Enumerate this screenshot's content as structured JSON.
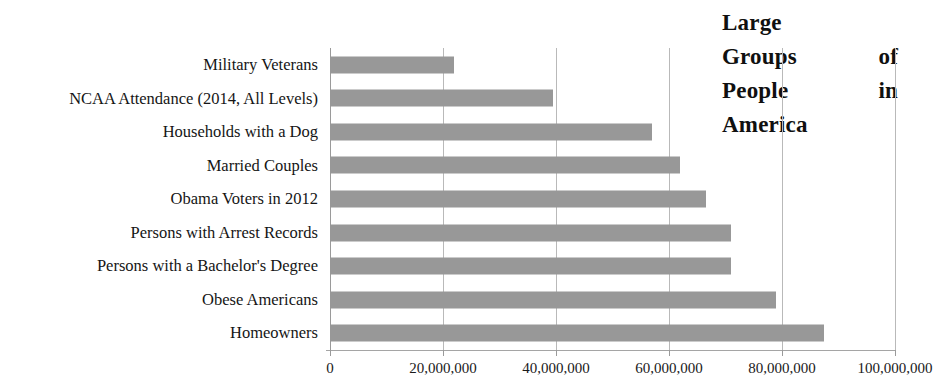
{
  "chart_data": {
    "type": "bar",
    "orientation": "horizontal",
    "title": "Large Groups of People in America",
    "title_lines": [
      "Large",
      "Groups of",
      "People in",
      "America"
    ],
    "xlabel": "",
    "ylabel": "",
    "categories": [
      "Military Veterans",
      "NCAA Attendance (2014, All Levels)",
      "Households with a Dog",
      "Married Couples",
      "Obama Voters in 2012",
      "Persons with Arrest Records",
      "Persons with a Bachelor's Degree",
      "Obese Americans",
      "Homeowners"
    ],
    "values": [
      22000000,
      39500000,
      57000000,
      62000000,
      66500000,
      71000000,
      71000000,
      79000000,
      87500000
    ],
    "xlim": [
      0,
      100000000
    ],
    "xticks": [
      0,
      20000000,
      40000000,
      60000000,
      80000000,
      100000000
    ],
    "xtick_labels": [
      "0",
      "20,000,000",
      "40,000,000",
      "60,000,000",
      "80,000,000",
      "100,000,000"
    ],
    "grid": true,
    "grid_axis": "x",
    "legend": false,
    "bar_color": "#989898",
    "grid_color": "#b9b9b9",
    "axis_color": "#9a9a9a",
    "text_color": "#1a1a1a"
  }
}
